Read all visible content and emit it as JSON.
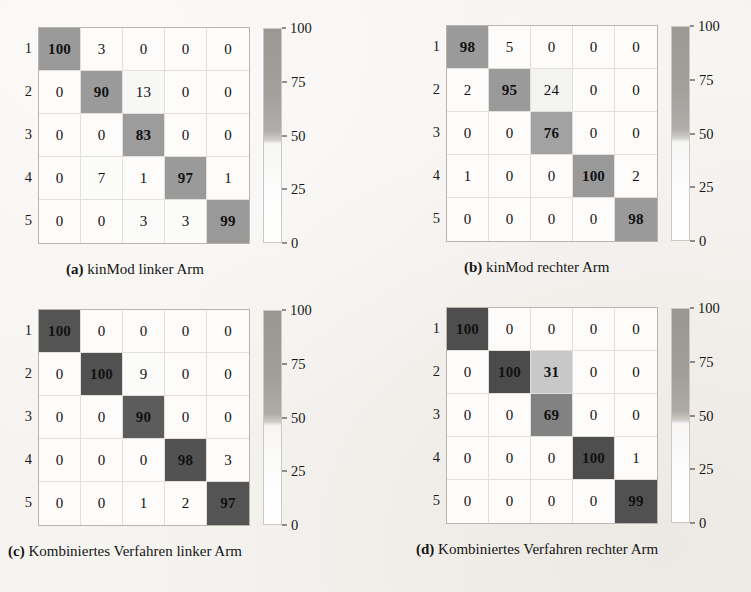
{
  "figure": {
    "row_labels": [
      "1",
      "2",
      "3",
      "4",
      "5"
    ],
    "colorbar_ticks": [
      "100",
      "75",
      "50",
      "25",
      "0"
    ],
    "colors": {
      "page_background": "#f6f4f1",
      "cell_background": "#fdfcfb",
      "grid_line": "#e3e0db",
      "matrix_border": "#b9b5ae",
      "high_light_panels": "#9a9a9a",
      "high_dark_panels": "#545454",
      "mid_gray": "#828282",
      "light_gray": "#c8c8c8",
      "text": "#111111"
    }
  },
  "chart_data": [
    {
      "type": "heatmap",
      "id": "a",
      "title": "kinMod linker Arm",
      "caption_label": "(a)",
      "caption_text": "kinMod linker Arm",
      "xlabel": "",
      "ylabel": "",
      "row_labels": [
        "1",
        "2",
        "3",
        "4",
        "5"
      ],
      "col_labels": [
        "1",
        "2",
        "3",
        "4",
        "5"
      ],
      "zlim": [
        0,
        100
      ],
      "colorbar_ticks": [
        100,
        75,
        50,
        25,
        0
      ],
      "grid": true,
      "values": [
        [
          100,
          3,
          0,
          0,
          0
        ],
        [
          0,
          90,
          13,
          0,
          0
        ],
        [
          0,
          0,
          83,
          0,
          0
        ],
        [
          0,
          7,
          1,
          97,
          1
        ],
        [
          0,
          0,
          3,
          3,
          99
        ]
      ],
      "cell_fills": [
        [
          "#9a9a9a",
          "#fdfcfb",
          "#fdfcfb",
          "#fdfcfb",
          "#fdfcfb"
        ],
        [
          "#fdfcfb",
          "#9a9a9a",
          "#f7f7f6",
          "#fdfcfb",
          "#fdfcfb"
        ],
        [
          "#fdfcfb",
          "#fdfcfb",
          "#9c9c9c",
          "#fdfcfb",
          "#fdfcfb"
        ],
        [
          "#fdfcfb",
          "#fbfbfa",
          "#fdfcfb",
          "#9a9a9a",
          "#fdfcfb"
        ],
        [
          "#fdfcfb",
          "#fdfcfb",
          "#fbfbfa",
          "#fbfbfa",
          "#999999"
        ]
      ]
    },
    {
      "type": "heatmap",
      "id": "b",
      "title": "kinMod rechter Arm",
      "caption_label": "(b)",
      "caption_text": "kinMod rechter Arm",
      "xlabel": "",
      "ylabel": "",
      "row_labels": [
        "1",
        "2",
        "3",
        "4",
        "5"
      ],
      "col_labels": [
        "1",
        "2",
        "3",
        "4",
        "5"
      ],
      "zlim": [
        0,
        100
      ],
      "colorbar_ticks": [
        100,
        75,
        50,
        25,
        0
      ],
      "grid": true,
      "values": [
        [
          98,
          5,
          0,
          0,
          0
        ],
        [
          2,
          95,
          24,
          0,
          0
        ],
        [
          0,
          0,
          76,
          0,
          0
        ],
        [
          1,
          0,
          0,
          100,
          2
        ],
        [
          0,
          0,
          0,
          0,
          98
        ]
      ],
      "cell_fills": [
        [
          "#9a9a9a",
          "#fdfcfb",
          "#fdfcfb",
          "#fdfcfb",
          "#fdfcfb"
        ],
        [
          "#fdfcfb",
          "#9a9a9a",
          "#f3f3f2",
          "#fdfcfb",
          "#fdfcfb"
        ],
        [
          "#fdfcfb",
          "#fdfcfb",
          "#a2a2a2",
          "#fdfcfb",
          "#fdfcfb"
        ],
        [
          "#fdfcfb",
          "#fdfcfb",
          "#fdfcfb",
          "#999999",
          "#fdfcfb"
        ],
        [
          "#fdfcfb",
          "#fdfcfb",
          "#fdfcfb",
          "#fdfcfb",
          "#9a9a9a"
        ]
      ]
    },
    {
      "type": "heatmap",
      "id": "c",
      "title": "Kombiniertes Verfahren linker Arm",
      "caption_label": "(c)",
      "caption_text": "Kombiniertes Verfahren linker Arm",
      "xlabel": "",
      "ylabel": "",
      "row_labels": [
        "1",
        "2",
        "3",
        "4",
        "5"
      ],
      "col_labels": [
        "1",
        "2",
        "3",
        "4",
        "5"
      ],
      "zlim": [
        0,
        100
      ],
      "colorbar_ticks": [
        100,
        75,
        50,
        25,
        0
      ],
      "grid": true,
      "values": [
        [
          100,
          0,
          0,
          0,
          0
        ],
        [
          0,
          100,
          9,
          0,
          0
        ],
        [
          0,
          0,
          90,
          0,
          0
        ],
        [
          0,
          0,
          0,
          98,
          3
        ],
        [
          0,
          0,
          1,
          2,
          97
        ]
      ],
      "cell_fills": [
        [
          "#545454",
          "#fdfcfb",
          "#fdfcfb",
          "#fdfcfb",
          "#fdfcfb"
        ],
        [
          "#fdfcfb",
          "#515151",
          "#fbfbfa",
          "#fdfcfb",
          "#fdfcfb"
        ],
        [
          "#fdfcfb",
          "#fdfcfb",
          "#5c5c5c",
          "#fdfcfb",
          "#fdfcfb"
        ],
        [
          "#fdfcfb",
          "#fdfcfb",
          "#fdfcfb",
          "#525252",
          "#fdfcfb"
        ],
        [
          "#fdfcfb",
          "#fdfcfb",
          "#fdfcfb",
          "#fdfcfb",
          "#545454"
        ]
      ]
    },
    {
      "type": "heatmap",
      "id": "d",
      "title": "Kombiniertes Verfahren rechter Arm",
      "caption_label": "(d)",
      "caption_text": "Kombiniertes Verfahren rechter Arm",
      "xlabel": "",
      "ylabel": "",
      "row_labels": [
        "1",
        "2",
        "3",
        "4",
        "5"
      ],
      "col_labels": [
        "1",
        "2",
        "3",
        "4",
        "5"
      ],
      "zlim": [
        0,
        100
      ],
      "colorbar_ticks": [
        100,
        75,
        50,
        25,
        0
      ],
      "grid": true,
      "values": [
        [
          100,
          0,
          0,
          0,
          0
        ],
        [
          0,
          100,
          31,
          0,
          0
        ],
        [
          0,
          0,
          69,
          0,
          0
        ],
        [
          0,
          0,
          0,
          100,
          1
        ],
        [
          0,
          0,
          0,
          0,
          99
        ]
      ],
      "cell_fills": [
        [
          "#4e4e4e",
          "#fdfcfb",
          "#fdfcfb",
          "#fdfcfb",
          "#fdfcfb"
        ],
        [
          "#fdfcfb",
          "#4b4b4b",
          "#c8c8c8",
          "#fdfcfb",
          "#fdfcfb"
        ],
        [
          "#fdfcfb",
          "#fdfcfb",
          "#828282",
          "#fdfcfb",
          "#fdfcfb"
        ],
        [
          "#fdfcfb",
          "#fdfcfb",
          "#fdfcfb",
          "#4e4e4e",
          "#fdfcfb"
        ],
        [
          "#fdfcfb",
          "#fdfcfb",
          "#fdfcfb",
          "#fdfcfb",
          "#515151"
        ]
      ]
    }
  ]
}
